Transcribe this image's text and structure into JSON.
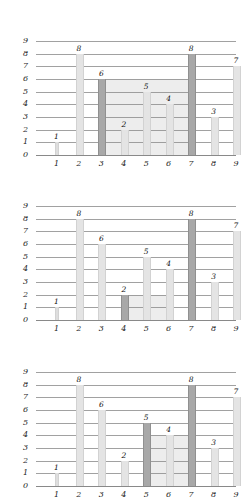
{
  "chart_data": [
    {
      "type": "bar",
      "title": "",
      "subtitle": "",
      "xlabel": "",
      "ylabel": "",
      "categories": [
        "1",
        "2",
        "3",
        "4",
        "5",
        "6",
        "7",
        "8",
        "9"
      ],
      "values": [
        1,
        8,
        6,
        2,
        5,
        4,
        8,
        3,
        7
      ],
      "bar_labels": [
        "1",
        "8",
        "6",
        "2",
        "5",
        "4",
        "8",
        "3",
        "7"
      ],
      "highlighted_bars": [
        3,
        7
      ],
      "highlighted_values": [
        6,
        8
      ],
      "shaded_region": {
        "x_start": 3,
        "x_end": 7,
        "height": 6,
        "area": 24
      },
      "xlim": [
        0,
        9
      ],
      "ylim": [
        0,
        9
      ],
      "y_ticks": [
        "0",
        "1",
        "2",
        "3",
        "4",
        "5",
        "6",
        "7",
        "8",
        "9"
      ],
      "x_ticks": [
        "1",
        "2",
        "3",
        "4",
        "5",
        "6",
        "7",
        "8",
        "9"
      ],
      "grid": true,
      "legend": "none"
    },
    {
      "type": "bar",
      "title": "",
      "subtitle": "",
      "xlabel": "",
      "ylabel": "",
      "categories": [
        "1",
        "2",
        "3",
        "4",
        "5",
        "6",
        "7",
        "8",
        "9"
      ],
      "values": [
        1,
        8,
        6,
        2,
        5,
        4,
        8,
        3,
        7
      ],
      "bar_labels": [
        "1",
        "8",
        "6",
        "2",
        "5",
        "4",
        "8",
        "3",
        "7"
      ],
      "highlighted_bars": [
        4,
        7
      ],
      "highlighted_values": [
        2,
        8
      ],
      "shaded_region": {
        "x_start": 4,
        "x_end": 6,
        "height": 2,
        "area": 4
      },
      "xlim": [
        0,
        9
      ],
      "ylim": [
        0,
        9
      ],
      "y_ticks": [
        "0",
        "1",
        "2",
        "3",
        "4",
        "5",
        "6",
        "7",
        "8",
        "9"
      ],
      "x_ticks": [
        "1",
        "2",
        "3",
        "4",
        "5",
        "6",
        "7",
        "8",
        "9"
      ],
      "grid": true,
      "legend": "none"
    },
    {
      "type": "bar",
      "title": "",
      "subtitle": "",
      "xlabel": "",
      "ylabel": "",
      "categories": [
        "1",
        "2",
        "3",
        "4",
        "5",
        "6",
        "7",
        "8",
        "9"
      ],
      "values": [
        1,
        8,
        6,
        2,
        5,
        4,
        8,
        3,
        7
      ],
      "bar_labels": [
        "1",
        "8",
        "6",
        "2",
        "5",
        "4",
        "8",
        "3",
        "7"
      ],
      "highlighted_bars": [
        5,
        7
      ],
      "highlighted_values": [
        5,
        8
      ],
      "shaded_region": {
        "x_start": 5,
        "x_end": 7,
        "height": 4,
        "area": 8
      },
      "xlim": [
        0,
        9
      ],
      "ylim": [
        0,
        9
      ],
      "y_ticks": [
        "0",
        "1",
        "2",
        "3",
        "4",
        "5",
        "6",
        "7",
        "8",
        "9"
      ],
      "x_ticks": [
        "1",
        "2",
        "3",
        "4",
        "5",
        "6",
        "7",
        "8",
        "9"
      ],
      "grid": true,
      "legend": "none"
    }
  ]
}
